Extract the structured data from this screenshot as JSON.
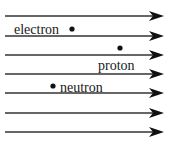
{
  "diagram": {
    "field_line_color": "#333333",
    "particle_color": "#111111",
    "field_lines_y": [
      16,
      36,
      55,
      74,
      93,
      113,
      132
    ],
    "field_line_x_start": 5,
    "field_line_x_end": 164,
    "particles": [
      {
        "label": "electron",
        "dot_x": 72,
        "dot_y": 29,
        "label_x": 14,
        "label_y": 23
      },
      {
        "label": "proton",
        "dot_x": 120,
        "dot_y": 48,
        "label_x": 98,
        "label_y": 59
      },
      {
        "label": "neutron",
        "dot_x": 53,
        "dot_y": 86,
        "label_x": 60,
        "label_y": 81
      }
    ]
  }
}
